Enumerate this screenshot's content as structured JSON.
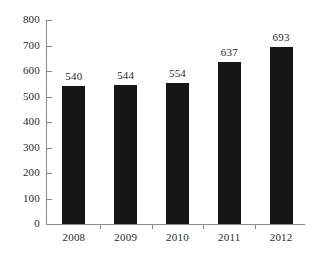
{
  "chart_data": {
    "type": "bar",
    "title": "",
    "subtitle": "",
    "xlabel": "",
    "ylabel": "",
    "categories": [
      "2008",
      "2009",
      "2010",
      "2011",
      "2012"
    ],
    "values": [
      540,
      544,
      554,
      637,
      693
    ],
    "data_labels": [
      "540",
      "544",
      "554",
      "637",
      "693"
    ],
    "ylim": [
      0,
      800
    ],
    "ytick_values": [
      0,
      100,
      200,
      300,
      400,
      500,
      600,
      700,
      800
    ],
    "ytick_labels": [
      "0",
      "100",
      "200",
      "300",
      "400",
      "500",
      "600",
      "700",
      "800"
    ],
    "grid": false,
    "legend": null,
    "series": [
      {
        "name": "",
        "values": [
          540,
          544,
          554,
          637,
          693
        ]
      }
    ],
    "colors": {
      "bar": "#161616",
      "axis": "#8a8a8a",
      "text": "#2b2b2b",
      "background": "#ffffff"
    }
  }
}
